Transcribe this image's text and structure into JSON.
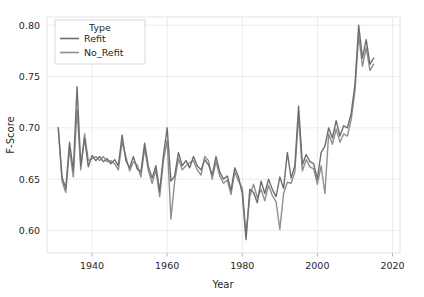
{
  "chart_data": {
    "type": "line",
    "title": "",
    "xlabel": "Year",
    "ylabel": "F-Score",
    "xlim": [
      1928,
      2022
    ],
    "ylim": [
      0.578,
      0.808
    ],
    "xticks": [
      1940,
      1960,
      1980,
      2000,
      2020
    ],
    "xtick_labels": [
      "1940",
      "1960",
      "1980",
      "2000",
      "2020"
    ],
    "yticks": [
      0.6,
      0.65,
      0.7,
      0.75,
      0.8
    ],
    "ytick_labels": [
      "0.60",
      "0.65",
      "0.70",
      "0.75",
      "0.80"
    ],
    "grid": true,
    "legend_position": "upper-left-inside",
    "legend_title": "Type",
    "colors": {
      "refit": "#6e6e6e",
      "no_refit": "#8f8f8f",
      "grid": "#ebebeb",
      "axis_text": "#262626",
      "background": "#ffffff",
      "legend_border": "#d9d9d9"
    },
    "x": [
      1931,
      1932,
      1933,
      1934,
      1935,
      1936,
      1937,
      1938,
      1939,
      1940,
      1941,
      1942,
      1943,
      1944,
      1945,
      1946,
      1947,
      1948,
      1949,
      1950,
      1951,
      1952,
      1953,
      1954,
      1955,
      1956,
      1957,
      1958,
      1959,
      1960,
      1961,
      1962,
      1963,
      1964,
      1965,
      1966,
      1967,
      1968,
      1969,
      1970,
      1971,
      1972,
      1973,
      1974,
      1975,
      1976,
      1977,
      1978,
      1979,
      1980,
      1981,
      1982,
      1983,
      1984,
      1985,
      1986,
      1987,
      1988,
      1989,
      1990,
      1991,
      1992,
      1993,
      1994,
      1995,
      1996,
      1997,
      1998,
      1999,
      2000,
      2001,
      2002,
      2003,
      2004,
      2005,
      2006,
      2007,
      2008,
      2009,
      2010,
      2011,
      2012,
      2013,
      2014,
      2015
    ],
    "series": [
      {
        "name": "Refit",
        "color": "#6e6e6e",
        "values": [
          0.7,
          0.652,
          0.641,
          0.686,
          0.658,
          0.74,
          0.663,
          0.69,
          0.662,
          0.673,
          0.668,
          0.672,
          0.667,
          0.67,
          0.665,
          0.669,
          0.663,
          0.693,
          0.668,
          0.661,
          0.672,
          0.66,
          0.657,
          0.685,
          0.662,
          0.651,
          0.663,
          0.638,
          0.673,
          0.7,
          0.648,
          0.653,
          0.676,
          0.663,
          0.668,
          0.661,
          0.672,
          0.663,
          0.659,
          0.669,
          0.664,
          0.654,
          0.672,
          0.657,
          0.65,
          0.653,
          0.639,
          0.661,
          0.652,
          0.636,
          0.591,
          0.64,
          0.637,
          0.627,
          0.648,
          0.636,
          0.65,
          0.64,
          0.633,
          0.652,
          0.641,
          0.676,
          0.651,
          0.663,
          0.721,
          0.664,
          0.674,
          0.667,
          0.665,
          0.65,
          0.676,
          0.682,
          0.7,
          0.69,
          0.707,
          0.692,
          0.702,
          0.7,
          0.714,
          0.742,
          0.8,
          0.768,
          0.786,
          0.762,
          0.768
        ]
      },
      {
        "name": "No_Refit",
        "color": "#8f8f8f",
        "values": [
          0.7,
          0.648,
          0.637,
          0.68,
          0.652,
          0.718,
          0.659,
          0.694,
          0.668,
          0.67,
          0.672,
          0.668,
          0.672,
          0.667,
          0.668,
          0.665,
          0.659,
          0.686,
          0.672,
          0.658,
          0.667,
          0.664,
          0.652,
          0.68,
          0.658,
          0.646,
          0.659,
          0.633,
          0.668,
          0.688,
          0.611,
          0.648,
          0.67,
          0.659,
          0.663,
          0.666,
          0.668,
          0.659,
          0.654,
          0.672,
          0.668,
          0.65,
          0.667,
          0.653,
          0.646,
          0.649,
          0.635,
          0.657,
          0.648,
          0.641,
          0.596,
          0.633,
          0.645,
          0.632,
          0.64,
          0.629,
          0.644,
          0.634,
          0.628,
          0.601,
          0.636,
          0.647,
          0.646,
          0.657,
          0.712,
          0.658,
          0.669,
          0.662,
          0.66,
          0.645,
          0.663,
          0.636,
          0.694,
          0.684,
          0.699,
          0.686,
          0.694,
          0.692,
          0.708,
          0.736,
          0.79,
          0.76,
          0.778,
          0.756,
          0.762
        ]
      }
    ]
  }
}
